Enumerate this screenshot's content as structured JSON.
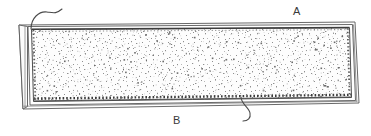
{
  "figure": {
    "type": "patent-line-drawing",
    "width": 371,
    "height": 136,
    "background_color": "#ffffff",
    "line_color": "#4a4a4a",
    "stipple_color": "#8a8a8a",
    "fill_color": "#fdfdfd"
  },
  "callouts": [
    {
      "id": "a",
      "label": "A",
      "description": "upper surface layer callout",
      "label_x": 293,
      "label_y": 5,
      "leader": {
        "description": "s-curve leader from top-left corner of panel",
        "path": "M 31 29 C 31 18, 39 11, 47 12 C 54 13, 56 14, 62 9"
      }
    },
    {
      "id": "b",
      "label": "B",
      "description": "lower hatched edge callout",
      "label_x": 173,
      "label_y": 114,
      "leader": {
        "description": "s-curve leader from bottom edge of panel",
        "path": "M 241 97 C 241 104, 249 107, 250 113 C 251 118, 248 121, 243 121"
      }
    }
  ],
  "geometry": {
    "outer_frame": {
      "description": "outermost perspective outline of the panel",
      "points": "19,25 355,22 359,103 23,109"
    },
    "spine": {
      "description": "left thick vertical band (edge/binding)",
      "points": "19,25 27,26 27,107 23,109"
    },
    "board_face": {
      "description": "front face of the board",
      "points": "27,26 352,25 355,100 29,105"
    },
    "inner_panel": {
      "description": "stippled inner field with hatched border",
      "points": "31,29 349,28 351,97 33,101"
    },
    "hatch_edges": [
      {
        "name": "top-hatch-edge",
        "description": "fine tick hatching along top inner edge"
      },
      {
        "name": "bottom-hatch-edge",
        "description": "serrated tick hatching along bottom inner edge"
      },
      {
        "name": "left-hatch-edge",
        "description": "fine tick hatching along left inner edge"
      },
      {
        "name": "right-hatch-edge",
        "description": "fine tick hatching along right inner edge"
      }
    ]
  },
  "texture": {
    "name": "stipple-fill",
    "description": "random speckled dot texture representing porous / granular material",
    "dot_count": 760,
    "dot_color": "#8f8f8f"
  }
}
